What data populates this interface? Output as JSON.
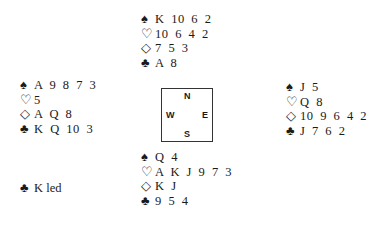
{
  "hands": {
    "north": {
      "spades": "K 10 6 2",
      "hearts": "10 6 4 2",
      "diamonds": "7 5 3",
      "clubs": "A 8"
    },
    "west": {
      "spades": "A 9 8 7 3",
      "hearts": "5",
      "diamonds": "A Q 8",
      "clubs": "K Q 10 3"
    },
    "east": {
      "spades": "J 5",
      "hearts": "Q 8",
      "diamonds": "10 9 6 4 2",
      "clubs": "J 7 6 2"
    },
    "south": {
      "spades": "Q 4",
      "hearts": "A K J 9 7 3",
      "diamonds": "K J",
      "clubs": "9 5 4"
    }
  },
  "suit_symbols": {
    "spades": "♠",
    "hearts": "♡",
    "diamonds": "◇",
    "clubs": "♣"
  },
  "compass": {
    "n": "N",
    "s": "S",
    "e": "E",
    "w": "W"
  },
  "opening_lead": {
    "suit": "♣",
    "text": "K led"
  }
}
